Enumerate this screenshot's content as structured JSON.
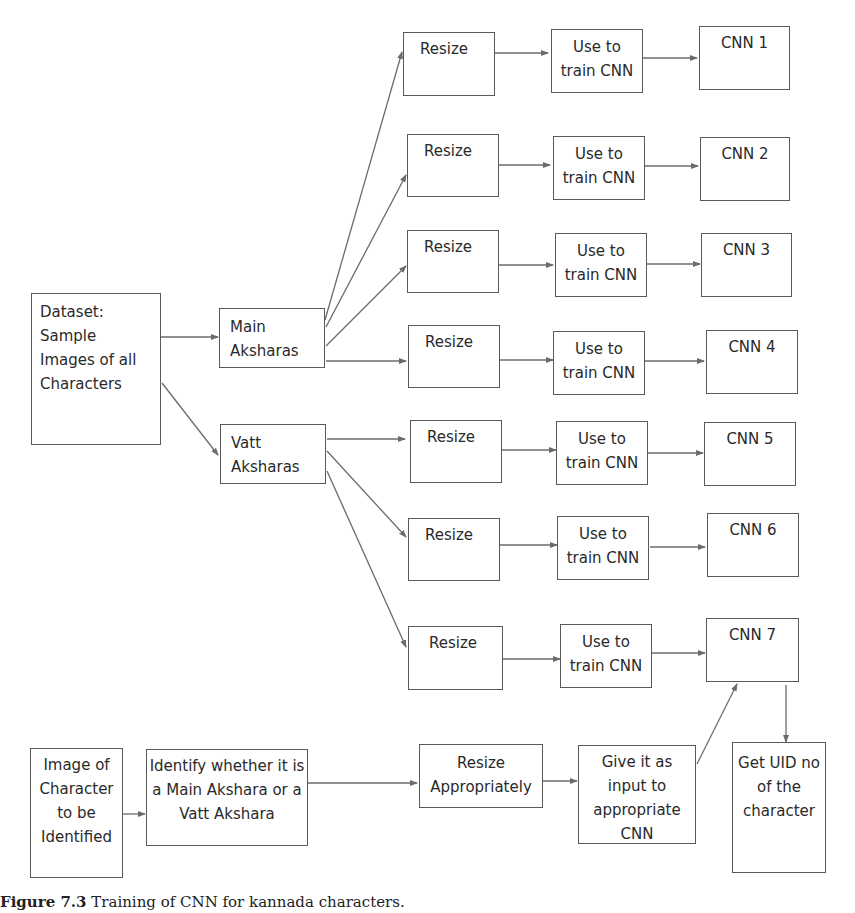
{
  "nodes": {
    "dataset": "Dataset: Sample Images of all Characters",
    "main": "Main Aksharas",
    "vatt": "Vatt Aksharas",
    "resize": [
      "Resize",
      "Resize",
      "Resize",
      "Resize",
      "Resize",
      "Resize",
      "Resize"
    ],
    "train": [
      "Use to train CNN",
      "Use to train CNN",
      "Use to train CNN",
      "Use to train CNN",
      "Use to train CNN",
      "Use to train CNN",
      "Use to train CNN"
    ],
    "cnn": [
      "CNN 1",
      "CNN 2",
      "CNN 3",
      "CNN 4",
      "CNN 5",
      "CNN 6",
      "CNN 7"
    ],
    "image": "Image of Character to be Identified",
    "identify": "Identify whether it is a Main Akshara or a Vatt Akshara",
    "resize_appropriately": "Resize Appropriately",
    "give_input": "Give it as input to appropriate CNN",
    "get_uid": "Get UID no of the character"
  },
  "caption": {
    "label": "Figure 7.3",
    "text": " Training of CNN for kannada characters."
  },
  "colors": {
    "line": "#6b6b6b",
    "border": "#5a5a5a"
  }
}
